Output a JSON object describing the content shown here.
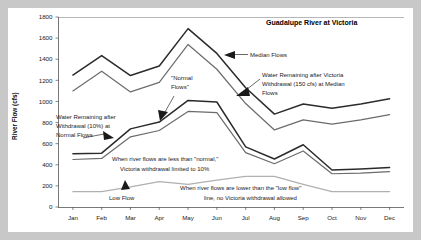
{
  "chart_data": {
    "type": "line",
    "title": "Guadalupe River at Victoria",
    "xlabel": "",
    "ylabel": "River Flow (cfs)",
    "categories": [
      "Jan",
      "Feb",
      "Mar",
      "Apr",
      "May",
      "Jun",
      "Jul",
      "Aug",
      "Sep",
      "Oct",
      "Nov",
      "Dec"
    ],
    "ylim": [
      0,
      1800
    ],
    "ytick_values": [
      0,
      200,
      400,
      600,
      800,
      1000,
      1200,
      1400,
      1600,
      1800
    ],
    "ytick_labels": [
      "0",
      "200",
      "400",
      "600",
      "800",
      "1000",
      "1200",
      "1400",
      "1600",
      "1800"
    ],
    "grid": false,
    "legend": "none",
    "series": [
      {
        "name": "Median Flows",
        "color": "#2b2b2b",
        "values": [
          1250,
          1435,
          1245,
          1335,
          1690,
          1455,
          1130,
          880,
          975,
          935,
          975,
          1025
        ]
      },
      {
        "name": "Water Remaining after Victoria Withdrawal (150 cfs) at Median Flows",
        "color": "#6b6b6b",
        "values": [
          1100,
          1285,
          1090,
          1180,
          1540,
          1305,
          980,
          730,
          825,
          785,
          825,
          875
        ]
      },
      {
        "name": "\"Normal Flows\"",
        "color": "#2b2b2b",
        "values": [
          505,
          510,
          740,
          805,
          1010,
          995,
          570,
          455,
          590,
          350,
          360,
          375
        ]
      },
      {
        "name": "Water Remaining after Withdrawal (10%) at Normal Flows",
        "color": "#6b6b6b",
        "values": [
          450,
          460,
          665,
          725,
          905,
          895,
          515,
          410,
          530,
          315,
          320,
          335
        ]
      },
      {
        "name": "Low Flow",
        "color": "#b0b0b0",
        "values": [
          145,
          145,
          190,
          240,
          215,
          255,
          290,
          290,
          215,
          145,
          145,
          145
        ]
      }
    ],
    "annotations": [
      {
        "name": "median-flows",
        "lines": [
          "Median Flows"
        ],
        "arrow": "left"
      },
      {
        "name": "victoria-withdrawal",
        "lines": [
          "Water Remaining after Victoria",
          "Withdrawal (150 cfs) at Median",
          "Flows"
        ],
        "arrow": "left-down"
      },
      {
        "name": "normal-flows",
        "lines": [
          "\"Normal",
          "Flows\""
        ],
        "arrow": "down-left"
      },
      {
        "name": "withdrawal-ten-percent",
        "lines": [
          "Water Remaining after",
          "Withdrawal (10%) at",
          "Normal Flows"
        ],
        "arrow": "right-down"
      },
      {
        "name": "less-than-normal-note",
        "lines": [
          "When river flows are less than \"normal,\"",
          "Victoria withdrawal limited to 10%"
        ],
        "arrow": "none"
      },
      {
        "name": "low-flow-label",
        "lines": [
          "Low Flow"
        ],
        "arrow": "up"
      },
      {
        "name": "lower-than-low-flow-note",
        "lines": [
          "When river flows are lower than the \"low flow\"",
          "line, no Victoria withdrawal allowed"
        ],
        "arrow": "none"
      }
    ]
  },
  "colors": {
    "page_background": "#c8c8c8",
    "card_background": "#ffffff",
    "axis": "#555555",
    "series_dark": "#2b2b2b",
    "series_mid": "#6b6b6b",
    "series_light": "#b0b0b0"
  }
}
